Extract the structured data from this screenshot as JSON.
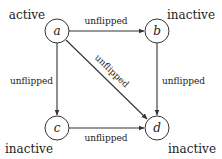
{
  "nodes": [
    {
      "id": "a",
      "label": "a",
      "state": "active"
    },
    {
      "id": "b",
      "label": "b",
      "state": "inactive"
    },
    {
      "id": "c",
      "label": "c",
      "state": "inactive"
    },
    {
      "id": "d",
      "label": "d",
      "state": "inactive"
    }
  ],
  "edges": [
    {
      "from": "a",
      "to": "b",
      "label": "unflipped"
    },
    {
      "from": "a",
      "to": "c",
      "label": "unflipped"
    },
    {
      "from": "a",
      "to": "d",
      "label": "unflipped"
    },
    {
      "from": "b",
      "to": "d",
      "label": "unflipped"
    },
    {
      "from": "c",
      "to": "d",
      "label": "unflipped"
    }
  ],
  "colors": {
    "stroke": "#333333",
    "text": "#222222",
    "background": "#ffffff"
  }
}
